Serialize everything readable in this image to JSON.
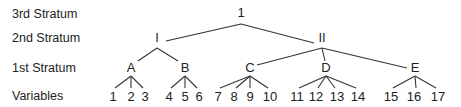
{
  "strata_labels": {
    "third": "3rd Stratum",
    "second": "2nd Stratum",
    "first": "1st Stratum",
    "variables": "Variables"
  },
  "tree": {
    "root": {
      "label": "1"
    },
    "second_stratum": [
      {
        "label": "I",
        "children": [
          "A",
          "B"
        ]
      },
      {
        "label": "II",
        "children": [
          "C",
          "D",
          "E"
        ]
      }
    ],
    "first_stratum": [
      {
        "label": "A",
        "variables": [
          "1",
          "2",
          "3"
        ]
      },
      {
        "label": "B",
        "variables": [
          "4",
          "5",
          "6"
        ]
      },
      {
        "label": "C",
        "variables": [
          "7",
          "8",
          "9",
          "10"
        ]
      },
      {
        "label": "D",
        "variables": [
          "11",
          "12",
          "13",
          "14"
        ]
      },
      {
        "label": "E",
        "variables": [
          "15",
          "16",
          "17"
        ]
      }
    ]
  }
}
